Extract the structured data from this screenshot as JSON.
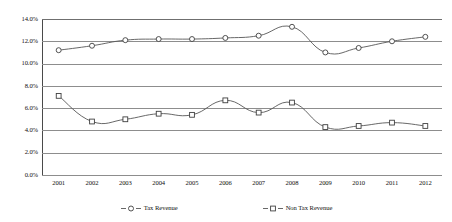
{
  "chart_data": {
    "type": "line",
    "title": "",
    "subtitle": "",
    "xlabel": "",
    "ylabel": "",
    "categories": [
      "2001",
      "2002",
      "2003",
      "2004",
      "2005",
      "2006",
      "2007",
      "2008",
      "2009",
      "2010",
      "2011",
      "2012"
    ],
    "ylim": [
      0.0,
      14.0
    ],
    "ytick_values": [
      14.0,
      12.0,
      10.0,
      8.0,
      6.0,
      4.0,
      2.0,
      0.0
    ],
    "ytick_labels": [
      "14.0%",
      "12.0%",
      "10.0%",
      "8.0%",
      "6.0%",
      "4.0%",
      "2.0%",
      "0.0%"
    ],
    "grid": true,
    "grid_axis": "y",
    "legend_position": "bottom",
    "value_unit": "percent",
    "series": [
      {
        "name": "Tax Revenue",
        "marker": "circle",
        "values": [
          11.2,
          11.6,
          12.1,
          12.2,
          12.2,
          12.3,
          12.5,
          13.3,
          11.0,
          11.4,
          12.0,
          12.4
        ]
      },
      {
        "name": "Non Tax Revenue",
        "marker": "square",
        "values": [
          7.1,
          4.8,
          5.0,
          5.5,
          5.4,
          6.7,
          5.6,
          6.5,
          4.3,
          4.4,
          4.7,
          4.4
        ]
      }
    ]
  },
  "legend": {
    "items": [
      {
        "label": "Tax Revenue",
        "marker": "circle"
      },
      {
        "label": "Non Tax Revenue",
        "marker": "square"
      }
    ]
  },
  "colors": {
    "series_line": "#575757",
    "marker_stroke": "#3f3f3f",
    "marker_fill": "#ffffff",
    "gridline": "#8d8d8d",
    "axis": "#4a4a4a",
    "text": "#111111",
    "background": "#ffffff"
  }
}
